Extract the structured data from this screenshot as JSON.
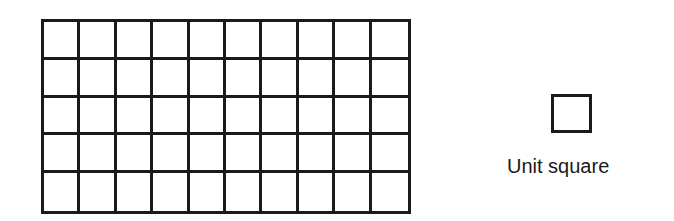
{
  "figure": {
    "grid": {
      "rows": 5,
      "columns": 10,
      "total_unit_squares": 50
    },
    "legend": {
      "label": "Unit square",
      "icon": "unit-square-icon"
    },
    "colors": {
      "stroke": "#1a1a1a",
      "background": "#ffffff"
    }
  }
}
